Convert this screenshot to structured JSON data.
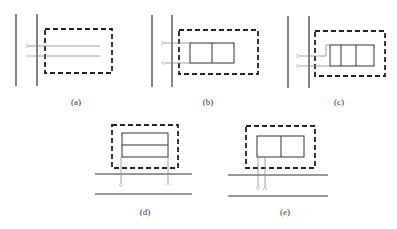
{
  "figure": {
    "panels": [
      {
        "id": "a",
        "label": "(a)",
        "inner_cells": 0,
        "orientation": "vertical-walls"
      },
      {
        "id": "b",
        "label": "(b)",
        "inner_cells": 2,
        "orientation": "vertical-walls"
      },
      {
        "id": "c",
        "label": "(c)",
        "inner_cells": 3,
        "orientation": "vertical-walls"
      },
      {
        "id": "d",
        "label": "(d)",
        "inner_cells": 2,
        "orientation": "horizontal-walls",
        "split": "horizontal"
      },
      {
        "id": "e",
        "label": "(e)",
        "inner_cells": 2,
        "orientation": "horizontal-walls",
        "split": "vertical"
      }
    ],
    "colors": {
      "wall": "#333333",
      "dashed_box": "#222222",
      "inner_rect": "#333333",
      "arrow": "#888888"
    }
  }
}
